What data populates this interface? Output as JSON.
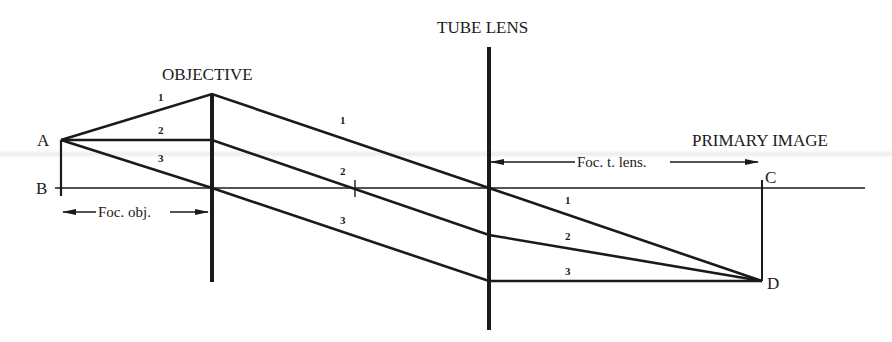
{
  "diagram": {
    "labels": {
      "objective": "OBJECTIVE",
      "tube_lens": "TUBE LENS",
      "primary_image": "PRIMARY IMAGE",
      "point_a": "A",
      "point_b": "B",
      "point_c": "C",
      "point_d": "D",
      "foc_obj": "Foc. obj.",
      "foc_tube_lens": "Foc. t. lens."
    },
    "ray_labels": {
      "obj_side": [
        "1",
        "2",
        "3"
      ],
      "mid": [
        "1",
        "2",
        "3"
      ],
      "image_side": [
        "1",
        "2",
        "3"
      ]
    },
    "colors": {
      "ink": "#1a1a1a",
      "background": "#ffffff"
    },
    "geometry": {
      "optical_axis_y": 188,
      "object": {
        "A": [
          61,
          140
        ],
        "B": [
          61,
          188
        ]
      },
      "objective": {
        "x": 212,
        "top": 94,
        "bottom": 282
      },
      "tube_lens": {
        "x": 489,
        "top": 47,
        "bottom": 330
      },
      "image": {
        "C": [
          762,
          188
        ],
        "D": [
          762,
          281
        ]
      },
      "rays": [
        {
          "id": "1",
          "points": [
            [
              61,
              140
            ],
            [
              212,
              94
            ],
            [
              489,
              188
            ],
            [
              762,
              281
            ]
          ]
        },
        {
          "id": "2",
          "points": [
            [
              61,
              140
            ],
            [
              212,
              140
            ],
            [
              489,
              235
            ],
            [
              762,
              281
            ]
          ]
        },
        {
          "id": "3",
          "points": [
            [
              61,
              140
            ],
            [
              212,
              188
            ],
            [
              489,
              281
            ],
            [
              762,
              281
            ]
          ]
        }
      ]
    }
  }
}
